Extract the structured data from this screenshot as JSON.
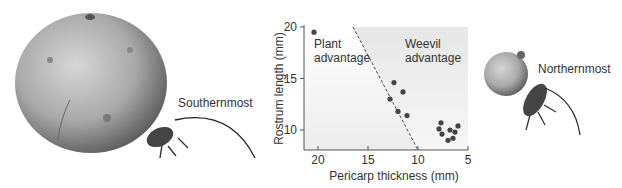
{
  "labels": {
    "southern": "Southernmost",
    "northern": "Northernmost"
  },
  "chart_data": {
    "type": "scatter",
    "title": "",
    "xlabel": "Pericarp thickness (mm)",
    "ylabel": "Rostrum length (mm)",
    "xlim": [
      22,
      4.5
    ],
    "ylim": [
      8.2,
      20.5
    ],
    "x_reversed": true,
    "xticks": [
      20,
      15,
      10,
      5
    ],
    "yticks": [
      10,
      15,
      20
    ],
    "grid": false,
    "legend": null,
    "annotations": [
      {
        "text": "Plant\nadvantage",
        "region": "left/lower of dashed line"
      },
      {
        "text": "Weevil\nadvantage",
        "region": "right/upper of dashed line (shaded)"
      }
    ],
    "divider_line": {
      "style": "dashed",
      "from": [
        16.5,
        20.5
      ],
      "to": [
        10,
        8.2
      ]
    },
    "points": [
      {
        "x": 20.4,
        "y": 19.5
      },
      {
        "x": 12.4,
        "y": 14.6
      },
      {
        "x": 11.5,
        "y": 13.7
      },
      {
        "x": 12.8,
        "y": 13.0
      },
      {
        "x": 12.0,
        "y": 11.8
      },
      {
        "x": 11.1,
        "y": 11.4
      },
      {
        "x": 7.7,
        "y": 10.7
      },
      {
        "x": 7.9,
        "y": 10.1
      },
      {
        "x": 7.6,
        "y": 9.6
      },
      {
        "x": 6.8,
        "y": 10.0
      },
      {
        "x": 6.0,
        "y": 10.4
      },
      {
        "x": 6.3,
        "y": 9.8
      },
      {
        "x": 6.5,
        "y": 9.2
      },
      {
        "x": 7.0,
        "y": 9.0
      }
    ]
  }
}
